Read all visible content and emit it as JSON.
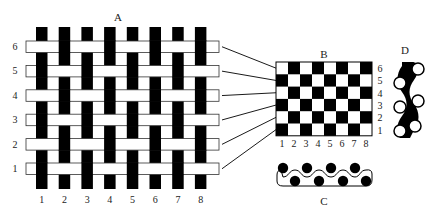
{
  "panels": {
    "A": {
      "label": "A",
      "description": "plain weave interlacing, 8 warp x 6 weft",
      "warp_labels": [
        "1",
        "2",
        "3",
        "4",
        "5",
        "6",
        "7",
        "8"
      ],
      "weft_labels": [
        "1",
        "2",
        "3",
        "4",
        "5",
        "6"
      ],
      "warp_color": "#000000",
      "weft_color": "#ffffff",
      "pattern_rows_top_to_bottom": [
        {
          "row": "6",
          "warp_over": [
            false,
            true,
            false,
            true,
            false,
            true,
            false,
            true
          ]
        },
        {
          "row": "5",
          "warp_over": [
            true,
            false,
            true,
            false,
            true,
            false,
            true,
            false
          ]
        },
        {
          "row": "4",
          "warp_over": [
            false,
            true,
            false,
            true,
            false,
            true,
            false,
            true
          ]
        },
        {
          "row": "3",
          "warp_over": [
            true,
            false,
            true,
            false,
            true,
            false,
            true,
            false
          ]
        },
        {
          "row": "2",
          "warp_over": [
            false,
            true,
            false,
            true,
            false,
            true,
            false,
            true
          ]
        },
        {
          "row": "1",
          "warp_over": [
            true,
            false,
            true,
            false,
            true,
            false,
            true,
            false
          ]
        }
      ]
    },
    "B": {
      "label": "B",
      "description": "point-paper (checkerboard) notation",
      "col_labels": [
        "1",
        "2",
        "3",
        "4",
        "5",
        "6",
        "7",
        "8"
      ],
      "row_labels_top_to_bottom": [
        "6",
        "5",
        "4",
        "3",
        "2",
        "1"
      ]
    },
    "C": {
      "label": "C",
      "description": "cross-section along weft"
    },
    "D": {
      "label": "D",
      "description": "cross-section along warp"
    }
  },
  "colors": {
    "ink": "#000000",
    "paper": "#ffffff",
    "outline": "#333333"
  }
}
